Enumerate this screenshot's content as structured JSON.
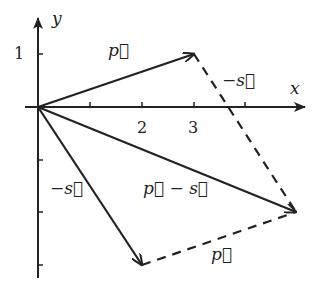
{
  "diagram": {
    "axes": {
      "x_label": "x",
      "y_label": "y"
    },
    "ticks": {
      "x": [
        "2",
        "3"
      ],
      "y": [
        "1"
      ]
    },
    "vectors": [
      {
        "name": "p",
        "label": "p⃗",
        "from": [
          0,
          0
        ],
        "to": [
          3,
          1
        ],
        "style": "solid"
      },
      {
        "name": "minus_s",
        "label": "−s⃗",
        "from": [
          0,
          0
        ],
        "to": [
          2,
          -3
        ],
        "style": "solid"
      },
      {
        "name": "p_minus_s",
        "label": "p⃗ − s⃗",
        "from": [
          0,
          0
        ],
        "to": [
          5,
          -2
        ],
        "style": "solid"
      },
      {
        "name": "minus_s_dashed",
        "label": "−s⃗",
        "from": [
          3,
          1
        ],
        "to": [
          5,
          -2
        ],
        "style": "dashed"
      },
      {
        "name": "p_dashed",
        "label": "p⃗",
        "from": [
          2,
          -3
        ],
        "to": [
          5,
          -2
        ],
        "style": "dashed"
      }
    ],
    "labels": {
      "p_top": "p⃗",
      "minus_s_right": "−s⃗",
      "minus_s_left": "−s⃗",
      "p_minus_s": "p⃗ − s⃗",
      "p_bottom": "p⃗"
    }
  }
}
